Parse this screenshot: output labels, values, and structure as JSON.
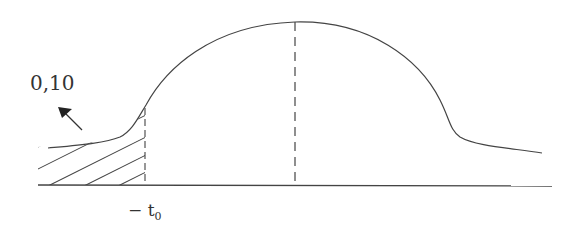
{
  "diagram": {
    "type": "curve-with-shaded-region",
    "colors": {
      "stroke": "#444444",
      "background": "#ffffff",
      "text": "#333333"
    },
    "labels": {
      "shaded_value": "0,10",
      "time_marker_prefix": "− t",
      "time_marker_subscript": "0"
    },
    "elements": [
      {
        "id": "baseline",
        "kind": "horizontal-axis"
      },
      {
        "id": "bell-curve",
        "kind": "curve",
        "description": "rising from left, peak at center, falling with tail to right"
      },
      {
        "id": "peak-dashed-line",
        "kind": "dashed vertical line at peak"
      },
      {
        "id": "t0-dashed-line",
        "kind": "dashed vertical line at -t0"
      },
      {
        "id": "shaded-region",
        "kind": "hatched area left of -t0 under curve"
      },
      {
        "id": "pointer-arrow",
        "kind": "arrow pointing from shaded area to label 0,10"
      }
    ]
  }
}
